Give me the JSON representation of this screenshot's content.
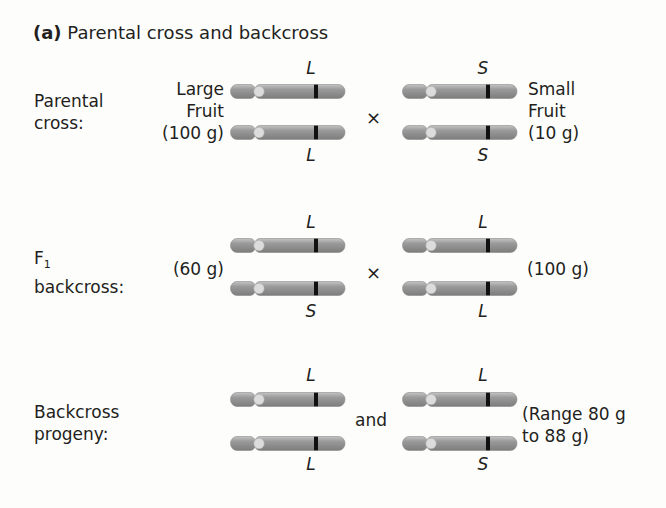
{
  "title": {
    "label": "(a)",
    "text": "Parental cross and backcross"
  },
  "colors": {
    "chromosome_body": "#9a9a9a",
    "chromosome_highlight": "#c4c4c4",
    "centromere": "#dcdcdc",
    "band": "#111111",
    "text": "#231f20"
  },
  "rows": [
    {
      "label_line1": "Parental",
      "label_line2": "cross:",
      "left": {
        "note_lines": [
          "Large",
          "Fruit",
          "(100 g)"
        ],
        "allele_top": "L",
        "allele_bottom": "L"
      },
      "connector": "×",
      "right": {
        "note_lines": [
          "Small",
          "Fruit",
          "(10 g)"
        ],
        "allele_top": "S",
        "allele_bottom": "S"
      }
    },
    {
      "label_line1": "F",
      "label_sub": "1",
      "label_line2": "backcross:",
      "left": {
        "note_lines": [
          "(60 g)"
        ],
        "allele_top": "L",
        "allele_bottom": "S"
      },
      "connector": "×",
      "right": {
        "note_lines": [
          "(100 g)"
        ],
        "allele_top": "L",
        "allele_bottom": "L"
      }
    },
    {
      "label_line1": "Backcross",
      "label_line2": "progeny:",
      "left": {
        "note_lines": [],
        "allele_top": "L",
        "allele_bottom": "L"
      },
      "connector": "and",
      "right": {
        "note_lines": [
          "(Range 80 g",
          "to 88 g)"
        ],
        "allele_top": "L",
        "allele_bottom": "S"
      }
    }
  ]
}
